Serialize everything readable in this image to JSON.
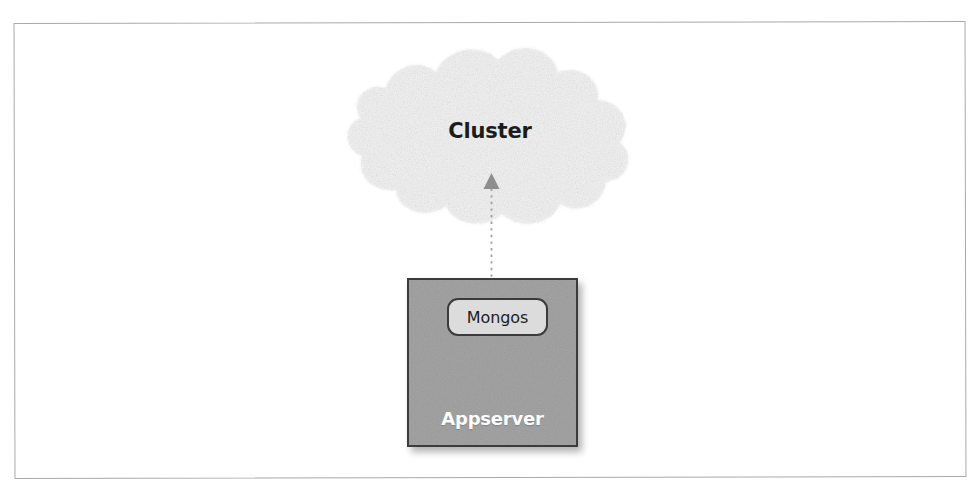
{
  "figure": {
    "nodes": {
      "cluster": {
        "label": "Cluster",
        "shape": "cloud-shape",
        "fill_color": "#f1f1f1",
        "text_color": "#1c1c1c"
      },
      "appserver": {
        "label": "Appserver",
        "shape": "rectangle",
        "fill_color": "#9c9c9c",
        "border_color": "#3b3b3b",
        "text_color": "#fdfdfd"
      },
      "mongos": {
        "label": "Mongos",
        "shape": "rounded-rectangle",
        "fill_color": "#dcdcdc",
        "border_color": "#3b3b3b",
        "text_color": "#1c1c1c"
      }
    },
    "connector": {
      "from": "appserver",
      "to": "cluster",
      "style": "dashed",
      "direction": "up",
      "arrowhead": "triangle",
      "color": "#9a9a9a"
    },
    "frame": {
      "border_color": "#a9a9ad"
    },
    "background_color": "#ffffff"
  }
}
